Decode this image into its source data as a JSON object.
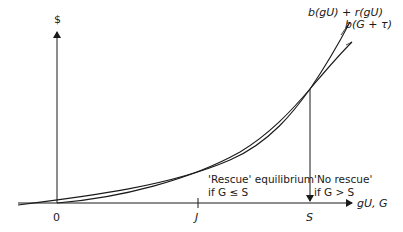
{
  "diagram": {
    "y_axis_label": "$",
    "x_axis_label": "gU, G",
    "origin_label": "0",
    "x_ticks": [
      {
        "label": "J",
        "x": 198
      },
      {
        "label": "S",
        "x": 310
      }
    ],
    "curves": [
      {
        "name": "b(gU) + r(gU)",
        "label": "b(gU) + r(gU)"
      },
      {
        "name": "b(G + τ)",
        "label": "b(G + τ)"
      }
    ],
    "annotations": {
      "rescue_line1": "'Rescue' equilibrium",
      "rescue_line2": "if G ≤ S",
      "norescue_line1": "'No rescue'",
      "norescue_line2": "if G > S"
    },
    "colors": {
      "line": "#1a1a1a",
      "background": "#ffffff"
    }
  }
}
